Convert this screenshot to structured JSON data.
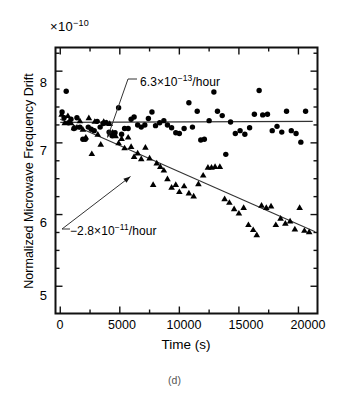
{
  "figure": {
    "caption": "(d)",
    "axis_multiplier_prefix": "×10",
    "axis_multiplier_exponent": "−10"
  },
  "annotations": {
    "upper": {
      "text_prefix": "6.3×10",
      "exponent": "−13",
      "suffix": "/hour"
    },
    "lower": {
      "text_prefix": "−2.8×10",
      "exponent": "−11",
      "suffix": "/hour"
    }
  },
  "chart_data": {
    "type": "scatter",
    "title": "",
    "xlabel": "Time   (s)",
    "ylabel": "Normalized Microwave Frequency Drift",
    "x_tick_labels": [
      "0",
      "5000",
      "10000",
      "15000",
      "20000"
    ],
    "x_ticks": [
      0,
      5000,
      10000,
      15000,
      20000
    ],
    "y_tick_labels": [
      "5",
      "6",
      "7",
      "8"
    ],
    "y_ticks": [
      5,
      6,
      7,
      8
    ],
    "xlim": [
      -400,
      21600
    ],
    "ylim": [
      4.62,
      8.33
    ],
    "grid": false,
    "legend": "none",
    "y_units": "1e-10",
    "series": [
      {
        "name": "circles",
        "marker": "filled-circle",
        "points": [
          [
            150,
            7.43
          ],
          [
            320,
            7.35
          ],
          [
            500,
            7.72
          ],
          [
            700,
            7.28
          ],
          [
            900,
            7.33
          ],
          [
            1150,
            7.2
          ],
          [
            1400,
            7.35
          ],
          [
            1650,
            7.22
          ],
          [
            1900,
            7.05
          ],
          [
            2100,
            7.05
          ],
          [
            2350,
            7.22
          ],
          [
            2600,
            7.19
          ],
          [
            2850,
            7.17
          ],
          [
            3100,
            7.3
          ],
          [
            3350,
            7.22
          ],
          [
            3600,
            7.27
          ],
          [
            3850,
            7.28
          ],
          [
            4100,
            7.15
          ],
          [
            4350,
            7.1
          ],
          [
            4600,
            7.14
          ],
          [
            4900,
            7.49
          ],
          [
            5150,
            7.12
          ],
          [
            5400,
            7.2
          ],
          [
            5700,
            7.2
          ],
          [
            5950,
            7.33
          ],
          [
            6200,
            7.36
          ],
          [
            6500,
            7.25
          ],
          [
            6800,
            7.22
          ],
          [
            7100,
            7.25
          ],
          [
            7400,
            7.34
          ],
          [
            7700,
            7.43
          ],
          [
            8000,
            7.24
          ],
          [
            8350,
            7.28
          ],
          [
            8700,
            7.31
          ],
          [
            9000,
            7.25
          ],
          [
            9350,
            7.21
          ],
          [
            9700,
            7.14
          ],
          [
            10000,
            7.13
          ],
          [
            10400,
            7.2
          ],
          [
            10800,
            7.56
          ],
          [
            11100,
            7.22
          ],
          [
            11500,
            7.44
          ],
          [
            11800,
            7.04
          ],
          [
            12100,
            7.05
          ],
          [
            12500,
            7.31
          ],
          [
            12900,
            7.71
          ],
          [
            13200,
            7.44
          ],
          [
            13600,
            7.38
          ],
          [
            13900,
            6.84
          ],
          [
            14300,
            7.29
          ],
          [
            14700,
            7.13
          ],
          [
            15100,
            7.17
          ],
          [
            15500,
            7.12
          ],
          [
            15900,
            7.21
          ],
          [
            16300,
            7.4
          ],
          [
            16700,
            7.73
          ],
          [
            17000,
            7.39
          ],
          [
            17400,
            7.4
          ],
          [
            17800,
            7.17
          ],
          [
            18200,
            7.23
          ],
          [
            18600,
            7.15
          ],
          [
            19000,
            7.44
          ],
          [
            19400,
            7.17
          ],
          [
            19800,
            7.13
          ],
          [
            20200,
            7.01
          ],
          [
            20600,
            7.44
          ]
        ]
      },
      {
        "name": "triangles",
        "marker": "filled-triangle",
        "points": [
          [
            120,
            7.4
          ],
          [
            380,
            7.28
          ],
          [
            640,
            7.38
          ],
          [
            900,
            7.28
          ],
          [
            1150,
            7.21
          ],
          [
            1400,
            7.22
          ],
          [
            1650,
            7.31
          ],
          [
            1900,
            7.19
          ],
          [
            2150,
            7.08
          ],
          [
            2400,
            7.35
          ],
          [
            2650,
            6.85
          ],
          [
            2900,
            7.3
          ],
          [
            3150,
            7.12
          ],
          [
            3400,
            6.98
          ],
          [
            3650,
            7.3
          ],
          [
            3900,
            7.28
          ],
          [
            4150,
            7.27
          ],
          [
            4400,
            7.15
          ],
          [
            4650,
            7.1
          ],
          [
            4900,
            7.0
          ],
          [
            5150,
            7.06
          ],
          [
            5400,
            6.93
          ],
          [
            5700,
            7.08
          ],
          [
            5950,
            6.95
          ],
          [
            6200,
            6.81
          ],
          [
            6500,
            6.86
          ],
          [
            6800,
            6.78
          ],
          [
            7150,
            6.94
          ],
          [
            7500,
            6.79
          ],
          [
            7800,
            6.42
          ],
          [
            8100,
            6.72
          ],
          [
            8400,
            6.67
          ],
          [
            8700,
            6.62
          ],
          [
            9000,
            6.5
          ],
          [
            9350,
            6.38
          ],
          [
            9700,
            6.42
          ],
          [
            10000,
            6.32
          ],
          [
            10400,
            6.4
          ],
          [
            10800,
            6.3
          ],
          [
            11200,
            6.26
          ],
          [
            11600,
            6.43
          ],
          [
            12000,
            6.55
          ],
          [
            12400,
            6.66
          ],
          [
            12700,
            6.66
          ],
          [
            13000,
            6.67
          ],
          [
            13400,
            6.67
          ],
          [
            13800,
            6.22
          ],
          [
            14200,
            6.17
          ],
          [
            14600,
            6.08
          ],
          [
            15000,
            6.02
          ],
          [
            15400,
            6.1
          ],
          [
            15800,
            5.86
          ],
          [
            16200,
            5.79
          ],
          [
            16500,
            5.72
          ],
          [
            16900,
            6.13
          ],
          [
            17300,
            6.1
          ],
          [
            17700,
            6.12
          ],
          [
            18100,
            5.86
          ],
          [
            18500,
            5.95
          ],
          [
            18900,
            5.88
          ],
          [
            19300,
            5.91
          ],
          [
            19700,
            5.8
          ],
          [
            20100,
            6.1
          ],
          [
            20500,
            5.78
          ],
          [
            20900,
            5.76
          ]
        ]
      }
    ],
    "trend_lines": [
      {
        "name": "flat-fit",
        "x0": 0,
        "y0": 7.285,
        "x1": 21200,
        "y1": 7.3,
        "slope_label": "6.3e-13/hour"
      },
      {
        "name": "declining-fit",
        "x0": 0,
        "y0": 7.33,
        "x1": 21400,
        "y1": 5.76,
        "slope_label": "-2.8e-11/hour"
      }
    ]
  }
}
